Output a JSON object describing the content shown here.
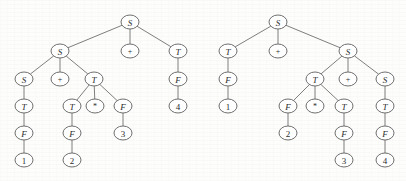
{
  "figure": {
    "kind": "parse-tree-pair",
    "background_color": "#fdfdfc",
    "node_stroke_color": "#5f5f5f",
    "edge_stroke_color": "#6f6f6f",
    "label_color": "#2b2b2b",
    "node_rx": 9,
    "node_ry": 7
  },
  "trees": [
    {
      "id": "left-tree",
      "name": "leftmost-derivation-parse-tree",
      "nodes": [
        {
          "id": "L0",
          "label": "S",
          "style": "italic",
          "x": 130,
          "y": 22
        },
        {
          "id": "L1",
          "label": "S",
          "style": "italic",
          "x": 60,
          "y": 51
        },
        {
          "id": "L2",
          "label": "+",
          "style": "op",
          "x": 130,
          "y": 51
        },
        {
          "id": "L3",
          "label": "T",
          "style": "italic",
          "x": 178,
          "y": 51
        },
        {
          "id": "L4",
          "label": "S",
          "style": "italic",
          "x": 24,
          "y": 79
        },
        {
          "id": "L5",
          "label": "+",
          "style": "op",
          "x": 60,
          "y": 79
        },
        {
          "id": "L6",
          "label": "T",
          "style": "italic",
          "x": 94,
          "y": 79
        },
        {
          "id": "L7",
          "label": "F",
          "style": "italic",
          "x": 178,
          "y": 79
        },
        {
          "id": "L8",
          "label": "T",
          "style": "italic",
          "x": 24,
          "y": 106
        },
        {
          "id": "L9",
          "label": "T",
          "style": "italic",
          "x": 72,
          "y": 106
        },
        {
          "id": "L10",
          "label": "*",
          "style": "op",
          "x": 95,
          "y": 106
        },
        {
          "id": "L11",
          "label": "F",
          "style": "italic",
          "x": 123,
          "y": 106
        },
        {
          "id": "L12",
          "label": "4",
          "style": "plain",
          "x": 178,
          "y": 106
        },
        {
          "id": "L13",
          "label": "F",
          "style": "italic",
          "x": 24,
          "y": 133
        },
        {
          "id": "L14",
          "label": "F",
          "style": "italic",
          "x": 72,
          "y": 133
        },
        {
          "id": "L15",
          "label": "3",
          "style": "plain",
          "x": 123,
          "y": 133
        },
        {
          "id": "L16",
          "label": "1",
          "style": "plain",
          "x": 24,
          "y": 160
        },
        {
          "id": "L17",
          "label": "2",
          "style": "plain",
          "x": 72,
          "y": 160
        }
      ],
      "edges": [
        [
          "L0",
          "L1"
        ],
        [
          "L0",
          "L2"
        ],
        [
          "L0",
          "L3"
        ],
        [
          "L1",
          "L4"
        ],
        [
          "L1",
          "L5"
        ],
        [
          "L1",
          "L6"
        ],
        [
          "L3",
          "L7"
        ],
        [
          "L7",
          "L12"
        ],
        [
          "L4",
          "L8"
        ],
        [
          "L8",
          "L13"
        ],
        [
          "L13",
          "L16"
        ],
        [
          "L6",
          "L9"
        ],
        [
          "L6",
          "L10"
        ],
        [
          "L6",
          "L11"
        ],
        [
          "L9",
          "L14"
        ],
        [
          "L14",
          "L17"
        ],
        [
          "L11",
          "L15"
        ]
      ]
    },
    {
      "id": "right-tree",
      "name": "rightmost-derivation-parse-tree",
      "nodes": [
        {
          "id": "R0",
          "label": "S",
          "style": "italic",
          "x": 278,
          "y": 22
        },
        {
          "id": "R1",
          "label": "T",
          "style": "italic",
          "x": 228,
          "y": 51
        },
        {
          "id": "R2",
          "label": "+",
          "style": "op",
          "x": 278,
          "y": 51
        },
        {
          "id": "R3",
          "label": "S",
          "style": "italic",
          "x": 348,
          "y": 51
        },
        {
          "id": "R4",
          "label": "F",
          "style": "italic",
          "x": 228,
          "y": 79
        },
        {
          "id": "R5",
          "label": "T",
          "style": "italic",
          "x": 315,
          "y": 79
        },
        {
          "id": "R6",
          "label": "+",
          "style": "op",
          "x": 348,
          "y": 79
        },
        {
          "id": "R7",
          "label": "S",
          "style": "italic",
          "x": 385,
          "y": 79
        },
        {
          "id": "R8",
          "label": "1",
          "style": "plain",
          "x": 228,
          "y": 106
        },
        {
          "id": "R9",
          "label": "F",
          "style": "italic",
          "x": 288,
          "y": 106
        },
        {
          "id": "R10",
          "label": "*",
          "style": "op",
          "x": 315,
          "y": 106
        },
        {
          "id": "R11",
          "label": "T",
          "style": "italic",
          "x": 344,
          "y": 106
        },
        {
          "id": "R12",
          "label": "T",
          "style": "italic",
          "x": 385,
          "y": 106
        },
        {
          "id": "R13",
          "label": "2",
          "style": "plain",
          "x": 288,
          "y": 133
        },
        {
          "id": "R14",
          "label": "F",
          "style": "italic",
          "x": 344,
          "y": 133
        },
        {
          "id": "R15",
          "label": "F",
          "style": "italic",
          "x": 385,
          "y": 133
        },
        {
          "id": "R16",
          "label": "3",
          "style": "plain",
          "x": 344,
          "y": 160
        },
        {
          "id": "R17",
          "label": "4",
          "style": "plain",
          "x": 385,
          "y": 160
        }
      ],
      "edges": [
        [
          "R0",
          "R1"
        ],
        [
          "R0",
          "R2"
        ],
        [
          "R0",
          "R3"
        ],
        [
          "R1",
          "R4"
        ],
        [
          "R4",
          "R8"
        ],
        [
          "R3",
          "R5"
        ],
        [
          "R3",
          "R6"
        ],
        [
          "R3",
          "R7"
        ],
        [
          "R5",
          "R9"
        ],
        [
          "R5",
          "R10"
        ],
        [
          "R5",
          "R11"
        ],
        [
          "R9",
          "R13"
        ],
        [
          "R11",
          "R14"
        ],
        [
          "R14",
          "R16"
        ],
        [
          "R7",
          "R12"
        ],
        [
          "R12",
          "R15"
        ],
        [
          "R15",
          "R17"
        ]
      ]
    }
  ]
}
